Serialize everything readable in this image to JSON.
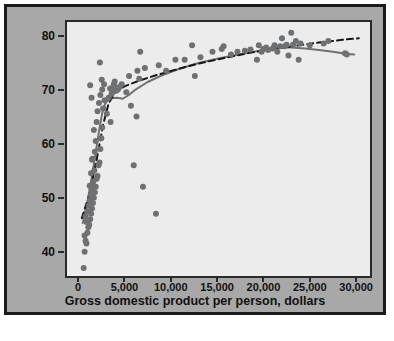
{
  "chart_data": {
    "type": "scatter",
    "title": "",
    "xlabel": "Gross domestic product per person, dollars",
    "ylabel": "Life expectancy, years",
    "xlim": [
      -1200,
      31500
    ],
    "ylim": [
      35.5,
      82.5
    ],
    "grid": false,
    "legend": "none",
    "xticks": [
      0,
      5000,
      10000,
      15000,
      20000,
      25000,
      30000
    ],
    "xtick_labels": [
      "0",
      "5,000",
      "10,000",
      "15,000",
      "20,000",
      "25,000",
      "30,000"
    ],
    "yticks": [
      40,
      50,
      60,
      70,
      80
    ],
    "ytick_labels": [
      "40",
      "50",
      "60",
      "70",
      "80"
    ],
    "marker_color": "#6f7072",
    "marker_size": 3.0,
    "points": [
      [
        600,
        37.0
      ],
      [
        700,
        40.0
      ],
      [
        800,
        42.0
      ],
      [
        900,
        41.5
      ],
      [
        1000,
        43.5
      ],
      [
        700,
        43.0
      ],
      [
        1100,
        44.5
      ],
      [
        900,
        45.5
      ],
      [
        1200,
        45.0
      ],
      [
        800,
        46.5
      ],
      [
        1300,
        46.0
      ],
      [
        1000,
        47.5
      ],
      [
        1400,
        47.0
      ],
      [
        1150,
        48.5
      ],
      [
        1500,
        48.0
      ],
      [
        1250,
        49.5
      ],
      [
        1600,
        49.0
      ],
      [
        1350,
        50.5
      ],
      [
        1700,
        50.0
      ],
      [
        1450,
        51.5
      ],
      [
        1800,
        51.0
      ],
      [
        1250,
        52.2
      ],
      [
        1550,
        52.3
      ],
      [
        1900,
        52.0
      ],
      [
        1650,
        53.0
      ],
      [
        2000,
        53.5
      ],
      [
        1400,
        54.5
      ],
      [
        2100,
        54.0
      ],
      [
        1750,
        55.0
      ],
      [
        1500,
        57.0
      ],
      [
        1550,
        57.2
      ],
      [
        2200,
        56.0
      ],
      [
        2300,
        56.5
      ],
      [
        1800,
        58.5
      ],
      [
        2400,
        59.0
      ],
      [
        1900,
        60.5
      ],
      [
        2500,
        61.0
      ],
      [
        1700,
        62.5
      ],
      [
        2600,
        63.0
      ],
      [
        2000,
        64.0
      ],
      [
        3500,
        64.0
      ],
      [
        3100,
        65.5
      ],
      [
        2100,
        66.0
      ],
      [
        2700,
        66.5
      ],
      [
        2250,
        67.5
      ],
      [
        2850,
        68.0
      ],
      [
        1450,
        68.5
      ],
      [
        3300,
        68.5
      ],
      [
        2400,
        69.0
      ],
      [
        3600,
        69.2
      ],
      [
        3700,
        69.5
      ],
      [
        2600,
        70.0
      ],
      [
        3450,
        70.2
      ],
      [
        3750,
        70.3
      ],
      [
        1300,
        70.8
      ],
      [
        2800,
        71.0
      ],
      [
        3850,
        71.0
      ],
      [
        3900,
        70.6
      ],
      [
        2550,
        71.8
      ],
      [
        3950,
        71.5
      ],
      [
        4100,
        69.8
      ],
      [
        4300,
        70.0
      ],
      [
        4500,
        70.5
      ],
      [
        2350,
        75.0
      ],
      [
        4700,
        71.0
      ],
      [
        5200,
        69.5
      ],
      [
        5500,
        72.5
      ],
      [
        5700,
        67.0
      ],
      [
        6000,
        56.0
      ],
      [
        6300,
        65.0
      ],
      [
        6400,
        73.5
      ],
      [
        6600,
        72.0
      ],
      [
        6700,
        77.0
      ],
      [
        7000,
        52.0
      ],
      [
        7200,
        74.0
      ],
      [
        8400,
        47.0
      ],
      [
        8700,
        74.5
      ],
      [
        9500,
        73.5
      ],
      [
        10500,
        75.5
      ],
      [
        11500,
        75.5
      ],
      [
        12300,
        78.2
      ],
      [
        12600,
        72.5
      ],
      [
        13200,
        76.0
      ],
      [
        14500,
        77.0
      ],
      [
        15500,
        77.5
      ],
      [
        15700,
        78.0
      ],
      [
        16500,
        76.5
      ],
      [
        17200,
        77.0
      ],
      [
        18000,
        77.2
      ],
      [
        18600,
        77.4
      ],
      [
        19300,
        75.5
      ],
      [
        19500,
        78.2
      ],
      [
        20000,
        77.5
      ],
      [
        20300,
        77.8
      ],
      [
        20500,
        77.3
      ],
      [
        21000,
        77.6
      ],
      [
        21200,
        78.2
      ],
      [
        21500,
        77.0
      ],
      [
        21800,
        78.0
      ],
      [
        22000,
        79.5
      ],
      [
        22300,
        78.0
      ],
      [
        22500,
        78.3
      ],
      [
        22700,
        76.3
      ],
      [
        23000,
        80.5
      ],
      [
        23200,
        78.3
      ],
      [
        23500,
        79.0
      ],
      [
        23800,
        75.5
      ],
      [
        24000,
        78.5
      ],
      [
        26500,
        78.5
      ],
      [
        27000,
        79.0
      ],
      [
        28800,
        76.7
      ],
      [
        29000,
        76.5
      ],
      [
        25000,
        78.2
      ],
      [
        19800,
        77.0
      ]
    ],
    "curves": [
      {
        "name": "smooth-fit-curve",
        "style": "solid",
        "color": "#6f7072",
        "width": 2.0,
        "points": [
          [
            500,
            45.3
          ],
          [
            800,
            47.5
          ],
          [
            1100,
            50.0
          ],
          [
            1400,
            53.0
          ],
          [
            1700,
            56.2
          ],
          [
            2000,
            59.5
          ],
          [
            2300,
            62.8
          ],
          [
            2600,
            65.6
          ],
          [
            2900,
            67.3
          ],
          [
            3200,
            68.1
          ],
          [
            3600,
            68.4
          ],
          [
            4200,
            68.5
          ],
          [
            4800,
            68.3
          ],
          [
            5400,
            68.9
          ],
          [
            6200,
            70.0
          ],
          [
            7500,
            71.4
          ],
          [
            9000,
            72.6
          ],
          [
            11000,
            73.9
          ],
          [
            13000,
            74.9
          ],
          [
            15000,
            75.7
          ],
          [
            17000,
            76.4
          ],
          [
            19000,
            77.0
          ],
          [
            20500,
            77.5
          ],
          [
            21800,
            77.8
          ],
          [
            23000,
            77.8
          ],
          [
            24500,
            77.6
          ],
          [
            26000,
            77.3
          ],
          [
            27500,
            77.0
          ],
          [
            29000,
            76.6
          ],
          [
            29800,
            76.5
          ]
        ]
      },
      {
        "name": "regression-dashed-line",
        "style": "dashed",
        "color": "#16161a",
        "width": 2.0,
        "points": [
          [
            400,
            46.2
          ],
          [
            1200,
            50.5
          ],
          [
            2000,
            57.0
          ],
          [
            2700,
            63.5
          ],
          [
            3300,
            67.5
          ],
          [
            4000,
            69.5
          ],
          [
            5000,
            70.6
          ],
          [
            6500,
            71.6
          ],
          [
            8500,
            72.7
          ],
          [
            11000,
            73.9
          ],
          [
            13500,
            75.0
          ],
          [
            16000,
            75.9
          ],
          [
            18500,
            76.8
          ],
          [
            21000,
            77.5
          ],
          [
            23500,
            78.1
          ],
          [
            26000,
            78.7
          ],
          [
            28500,
            79.2
          ],
          [
            30300,
            79.5
          ]
        ]
      }
    ]
  },
  "figure": {
    "frame_color": "#1b1b1b",
    "panel_background": "#a8a8a8",
    "plot_background": "#ececed"
  }
}
